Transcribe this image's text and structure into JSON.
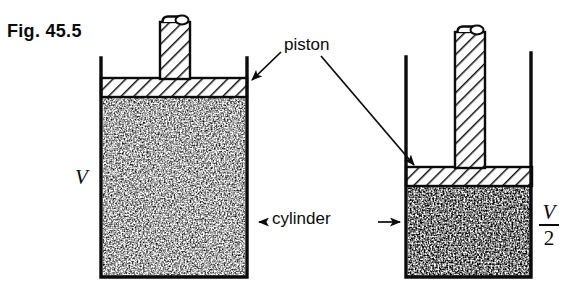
{
  "figure": {
    "caption": "Fig. 45.5"
  },
  "labels": {
    "piston": "piston",
    "cylinder": "cylinder",
    "volume_left": "V",
    "volume_right_numerator": "V",
    "volume_right_denominator": "2"
  },
  "colors": {
    "ink": "#0b0b0b",
    "background": "#ffffff",
    "hatch": "#111111",
    "speckle": "#1a1a1a"
  },
  "geometry": {
    "left_cylinder": {
      "wall_left_x": 100,
      "wall_right_x": 248,
      "wall_top_y": 58,
      "bottom_y": 277,
      "piston_slab_top_y": 78,
      "piston_slab_bottom_y": 97,
      "gas_top_y": 97,
      "rod_left_x": 160,
      "rod_right_x": 190,
      "rod_top_y": 18
    },
    "right_cylinder": {
      "wall_left_x": 405,
      "wall_right_x": 532,
      "wall_top_y": 55,
      "bottom_y": 277,
      "piston_slab_top_y": 167,
      "piston_slab_bottom_y": 186,
      "gas_top_y": 186,
      "rod_left_x": 455,
      "rod_right_x": 485,
      "rod_top_y": 28
    }
  }
}
